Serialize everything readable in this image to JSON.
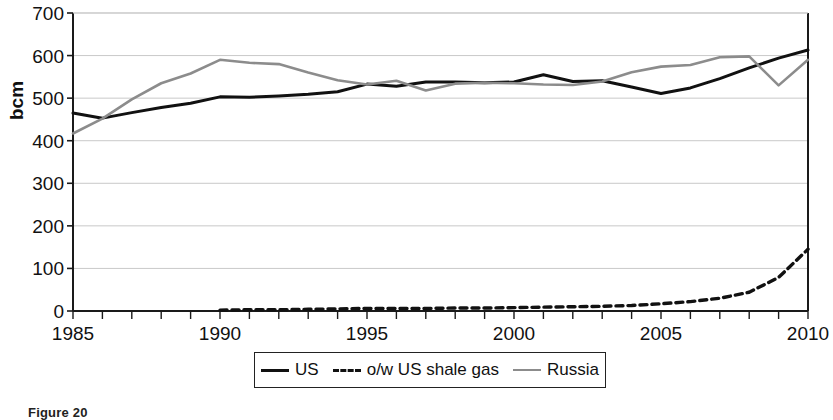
{
  "axes": {
    "ylabel": "bcm",
    "yticks": [
      "0",
      "100",
      "200",
      "300",
      "400",
      "500",
      "600",
      "700"
    ],
    "xticks": [
      "1985",
      "1990",
      "1995",
      "2000",
      "2005",
      "2010"
    ]
  },
  "legend": {
    "items": [
      {
        "label": "US",
        "style": "solid-black",
        "color": "#111111"
      },
      {
        "label": "o/w US shale gas",
        "style": "dashed-black",
        "color": "#111111"
      },
      {
        "label": "Russia",
        "style": "solid-gray",
        "color": "#8c8c8c"
      }
    ]
  },
  "caption": {
    "text": "Figure 20"
  },
  "chart_data": {
    "type": "line",
    "title": "",
    "xlabel": "",
    "ylabel": "bcm",
    "xlim": [
      1985,
      2010
    ],
    "ylim": [
      0,
      700
    ],
    "ytick_values": [
      0,
      100,
      200,
      300,
      400,
      500,
      600,
      700
    ],
    "xtick_values": [
      1985,
      1990,
      1995,
      2000,
      2005,
      2010
    ],
    "minor_xticks_every": 1,
    "grid": "horizontal",
    "legend_position": "below-center",
    "x": [
      1985,
      1986,
      1987,
      1988,
      1989,
      1990,
      1991,
      1992,
      1993,
      1994,
      1995,
      1996,
      1997,
      1998,
      1999,
      2000,
      2001,
      2002,
      2003,
      2004,
      2005,
      2006,
      2007,
      2008,
      2009,
      2010
    ],
    "series": [
      {
        "name": "US",
        "color": "#111111",
        "style": "solid",
        "values": [
          465,
          453,
          466,
          478,
          488,
          503,
          502,
          505,
          509,
          515,
          533,
          528,
          538,
          538,
          536,
          538,
          555,
          539,
          541,
          526,
          511,
          524,
          546,
          571,
          594,
          613
        ]
      },
      {
        "name": "o/w US shale gas",
        "color": "#111111",
        "style": "dashed",
        "values": [
          null,
          null,
          null,
          null,
          null,
          2,
          3,
          3,
          4,
          5,
          6,
          6,
          6,
          7,
          7,
          8,
          9,
          10,
          11,
          13,
          17,
          22,
          30,
          44,
          79,
          145
        ]
      },
      {
        "name": "Russia",
        "color": "#8c8c8c",
        "style": "solid",
        "values": [
          417,
          452,
          497,
          535,
          558,
          590,
          583,
          580,
          560,
          542,
          532,
          541,
          518,
          534,
          536,
          535,
          532,
          531,
          539,
          561,
          574,
          578,
          596,
          598,
          530,
          590
        ]
      }
    ]
  }
}
